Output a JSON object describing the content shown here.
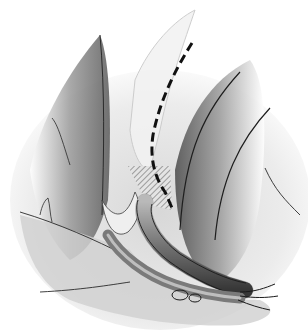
{
  "image": {
    "kind": "grayscale surgical anatomical illustration",
    "colors": {
      "background": "#ffffff",
      "line": "#1a1a1a",
      "shade_dark": "#4a4a4a",
      "shade_mid": "#8c8c8c",
      "shade_light": "#d4d4d4"
    }
  }
}
